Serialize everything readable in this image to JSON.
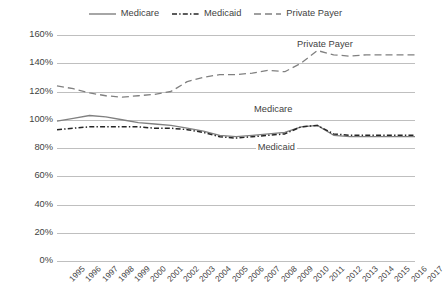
{
  "chart_data": {
    "type": "line",
    "title": "",
    "xlabel": "",
    "ylabel": "",
    "ylim": [
      0,
      160
    ],
    "ytick_step": 20,
    "grid": true,
    "legend_position": "top-center",
    "ytick_labels": [
      "160%",
      "140%",
      "120%",
      "100%",
      "80%",
      "60%",
      "40%",
      "20%",
      "0%"
    ],
    "ytick_values": [
      160,
      140,
      120,
      100,
      80,
      60,
      40,
      20,
      0
    ],
    "categories": [
      "1995",
      "1996",
      "1997",
      "1998",
      "1999",
      "2000",
      "2001",
      "2002",
      "2003",
      "2004",
      "2005",
      "2006",
      "2007",
      "2008",
      "2009",
      "2010",
      "2011",
      "2012",
      "2013",
      "2014",
      "2015",
      "2016",
      "2017"
    ],
    "series": [
      {
        "name": "Medicare",
        "style": "solid",
        "color": "#808080",
        "values": [
          99,
          101,
          103,
          102,
          100,
          98,
          97,
          96,
          94,
          92,
          89,
          88,
          89,
          90,
          91,
          95,
          96,
          89,
          88,
          88,
          88,
          88,
          88
        ]
      },
      {
        "name": "Medicaid",
        "style": "dash-dot",
        "color": "#262626",
        "values": [
          93,
          94,
          95,
          95,
          95,
          95,
          94,
          94,
          93,
          91,
          88,
          87,
          88,
          89,
          90,
          95,
          96,
          90,
          89,
          89,
          89,
          89,
          89
        ]
      },
      {
        "name": "Private Payer",
        "style": "dashed",
        "color": "#808080",
        "values": [
          124,
          122,
          119,
          117,
          116,
          117,
          118,
          120,
          127,
          130,
          132,
          132,
          133,
          135,
          134,
          140,
          149,
          146,
          145,
          146,
          146,
          146,
          146
        ]
      }
    ],
    "annotations": [
      {
        "text": "Private Payer",
        "series": "Private Payer",
        "x_pct": 0.665,
        "y_value": 152
      },
      {
        "text": "Medicare",
        "series": "Medicare",
        "x_pct": 0.545,
        "y_value": 106
      },
      {
        "text": "Medicaid",
        "series": "Medicaid",
        "x_pct": 0.555,
        "y_value": 79
      }
    ]
  },
  "legend": {
    "items": [
      {
        "label": "Medicare",
        "style": "solid",
        "color": "#808080"
      },
      {
        "label": "Medicaid",
        "style": "dash-dot",
        "color": "#262626"
      },
      {
        "label": "Private Payer",
        "style": "dashed",
        "color": "#808080"
      }
    ]
  },
  "colors": {
    "grid": "#bfbfbf",
    "text": "#3f3f3f",
    "background": "#ffffff"
  }
}
